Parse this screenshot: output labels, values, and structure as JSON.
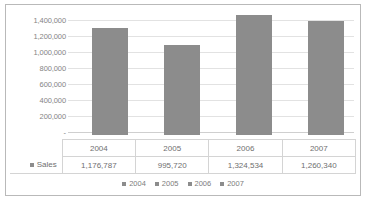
{
  "chart_data": {
    "type": "bar",
    "title": "",
    "xlabel": "",
    "ylabel": "",
    "categories": [
      "2004",
      "2005",
      "2006",
      "2007"
    ],
    "series": [
      {
        "name": "Sales",
        "values": [
          1176787,
          995720,
          1324534,
          1260340
        ],
        "value_labels": [
          "1,176,787",
          "995,720",
          "1,324,534",
          "1,260,340"
        ]
      }
    ],
    "ylim": [
      0,
      1400000
    ],
    "ytick_labels": [
      "1,400,000",
      "1,200,000",
      "1,000,000",
      "800,000",
      "600,000",
      "400,000",
      "200,000",
      "-"
    ],
    "ytick_values": [
      1400000,
      1200000,
      1000000,
      800000,
      600000,
      400000,
      200000,
      0
    ],
    "grid": true,
    "legend_position": "bottom",
    "legend_entries": [
      "2004",
      "2005",
      "2006",
      "2007"
    ],
    "bar_color": "#8c8c8c",
    "gridline_color": "#e2e2e2",
    "data_table_visible": true
  },
  "data_table": {
    "header": [
      "",
      "2004",
      "2005",
      "2006",
      "2007"
    ],
    "rows": [
      {
        "label": "Sales",
        "cells": [
          "1,176,787",
          "995,720",
          "1,324,534",
          "1,260,340"
        ]
      }
    ]
  }
}
